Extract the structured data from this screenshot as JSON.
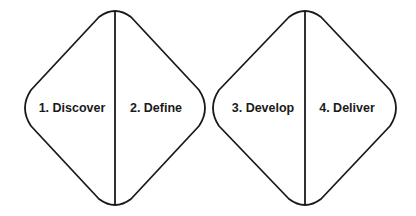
{
  "diagram": {
    "stroke_color": "#1a1a1a",
    "background": "#ffffff",
    "diamonds": [
      {
        "id": "diamond-1",
        "phases": [
          {
            "label": "1. Discover"
          },
          {
            "label": "2. Define"
          }
        ]
      },
      {
        "id": "diamond-2",
        "phases": [
          {
            "label": "3. Develop"
          },
          {
            "label": "4. Deliver"
          }
        ]
      }
    ]
  }
}
